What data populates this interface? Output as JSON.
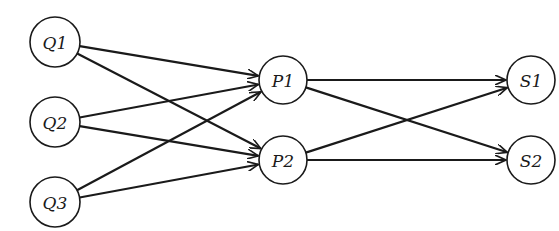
{
  "diagram": {
    "type": "directed-graph",
    "width": 559,
    "height": 231,
    "colors": {
      "stroke": "#1a1a1a",
      "fill": "#ffffff",
      "background": "#ffffff"
    },
    "nodes": [
      {
        "id": "Q1",
        "label": "Q1",
        "x": 55,
        "y": 42,
        "r": 25
      },
      {
        "id": "Q2",
        "label": "Q2",
        "x": 55,
        "y": 122,
        "r": 25
      },
      {
        "id": "Q3",
        "label": "Q3",
        "x": 55,
        "y": 202,
        "r": 25
      },
      {
        "id": "P1",
        "label": "P1",
        "x": 283,
        "y": 80,
        "r": 24
      },
      {
        "id": "P2",
        "label": "P2",
        "x": 283,
        "y": 160,
        "r": 24
      },
      {
        "id": "S1",
        "label": "S1",
        "x": 531,
        "y": 80,
        "r": 24
      },
      {
        "id": "S2",
        "label": "S2",
        "x": 531,
        "y": 160,
        "r": 24
      }
    ],
    "edges": [
      {
        "from": "Q1",
        "to": "P1"
      },
      {
        "from": "Q1",
        "to": "P2"
      },
      {
        "from": "Q2",
        "to": "P1"
      },
      {
        "from": "Q2",
        "to": "P2"
      },
      {
        "from": "Q3",
        "to": "P1"
      },
      {
        "from": "Q3",
        "to": "P2"
      },
      {
        "from": "P1",
        "to": "S1"
      },
      {
        "from": "P1",
        "to": "S2"
      },
      {
        "from": "P2",
        "to": "S1"
      },
      {
        "from": "P2",
        "to": "S2"
      }
    ]
  }
}
